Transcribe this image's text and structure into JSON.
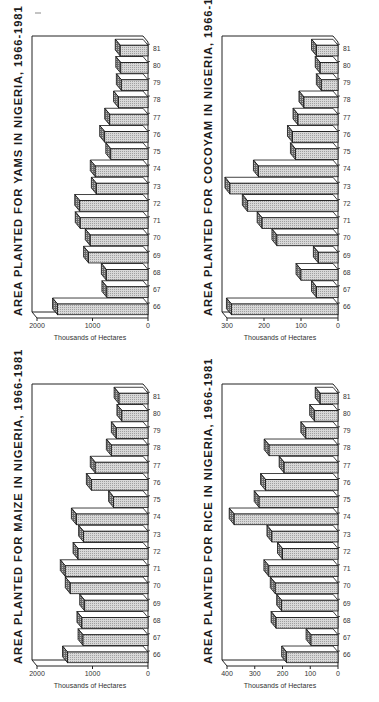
{
  "page": {
    "layout": "2x2 grid of 3D bar charts, printed rotated 90 degrees counter-clockwise"
  },
  "chart_data": [
    {
      "id": "yams",
      "type": "bar",
      "title": "AREA PLANTED FOR YAMS IN NIGERIA, 1966-1981",
      "xlabel": "",
      "ylabel": "Thousands of Hectares",
      "categories": [
        "66",
        "67",
        "68",
        "69",
        "70",
        "71",
        "72",
        "73",
        "74",
        "75",
        "76",
        "77",
        "78",
        "79",
        "80",
        "81"
      ],
      "values": [
        1630,
        740,
        750,
        1070,
        1040,
        1220,
        1230,
        930,
        950,
        670,
        780,
        690,
        530,
        480,
        490,
        500
      ],
      "yticks": [
        "0",
        "1000",
        "2000"
      ],
      "ylim": [
        0,
        2000
      ],
      "grid": false,
      "style": "3d"
    },
    {
      "id": "cocoyam",
      "type": "bar",
      "title": "AREA PLANTED FOR COCOYAM IN NIGERIA, 1966-1981",
      "xlabel": "",
      "ylabel": "Thousands of Hectares",
      "categories": [
        "66",
        "67",
        "68",
        "69",
        "70",
        "71",
        "72",
        "73",
        "74",
        "75",
        "76",
        "77",
        "78",
        "79",
        "80",
        "81"
      ],
      "values": [
        288,
        58,
        100,
        53,
        165,
        205,
        245,
        292,
        215,
        115,
        123,
        108,
        92,
        45,
        48,
        58
      ],
      "yticks": [
        "0",
        "100",
        "200",
        "300"
      ],
      "ylim": [
        0,
        300
      ],
      "grid": false,
      "style": "3d"
    },
    {
      "id": "maize",
      "type": "bar",
      "title": "AREA PLANTED FOR MAIZE IN NIGERIA, 1966-1981",
      "xlabel": "",
      "ylabel": "Thousands of Hectares",
      "categories": [
        "66",
        "67",
        "68",
        "69",
        "70",
        "71",
        "72",
        "73",
        "74",
        "75",
        "76",
        "77",
        "78",
        "79",
        "80",
        "81"
      ],
      "values": [
        1450,
        1170,
        1190,
        1140,
        1400,
        1490,
        1260,
        1160,
        1290,
        620,
        1020,
        950,
        660,
        570,
        470,
        520
      ],
      "yticks": [
        "0",
        "1000",
        "2000"
      ],
      "ylim": [
        0,
        2000
      ],
      "grid": false,
      "style": "3d"
    },
    {
      "id": "rice",
      "type": "bar",
      "title": "AREA PLANTED FOR RICE IN NIGERIA, 1966-1981",
      "xlabel": "",
      "ylabel": "Thousands of Hectares",
      "categories": [
        "66",
        "67",
        "68",
        "69",
        "70",
        "71",
        "72",
        "73",
        "74",
        "75",
        "76",
        "77",
        "78",
        "79",
        "80",
        "81"
      ],
      "values": [
        185,
        97,
        223,
        203,
        226,
        249,
        200,
        238,
        374,
        284,
        261,
        194,
        248,
        116,
        84,
        64
      ],
      "yticks": [
        "0",
        "100",
        "200",
        "300",
        "400"
      ],
      "ylim": [
        0,
        400
      ],
      "grid": false,
      "style": "3d"
    }
  ]
}
